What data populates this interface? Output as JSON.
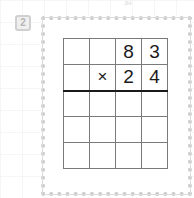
{
  "page": {
    "top_mark": "JH",
    "question_number": "2"
  },
  "problem": {
    "operation": "multiplication",
    "multiplicand": "83",
    "multiplier": "24",
    "rows": [
      [
        "",
        "",
        "8",
        "3"
      ],
      [
        "",
        "×",
        "2",
        "4"
      ],
      [
        "",
        "",
        "",
        ""
      ],
      [
        "",
        "",
        "",
        ""
      ],
      [
        "",
        "",
        "",
        ""
      ]
    ]
  }
}
